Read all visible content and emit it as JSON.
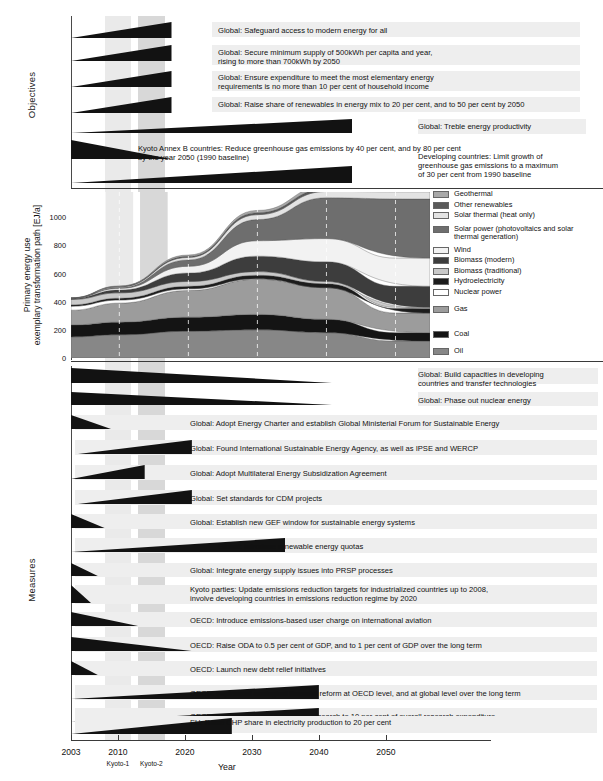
{
  "figure": {
    "sections": {
      "objectives_label": "Objectives",
      "measures_label": "Measures"
    },
    "x_axis": {
      "title": "Year",
      "ticks": [
        2003,
        2010,
        2020,
        2030,
        2040,
        2050
      ],
      "tick_labels": [
        "2003",
        "2010",
        "2020",
        "2030",
        "2040",
        "2050"
      ],
      "commitment_periods": [
        "Kyoto-1",
        "Kyoto-2"
      ],
      "range": [
        2003,
        2055
      ]
    },
    "shading": {
      "band1_color": "#eaeaea",
      "band2_color": "#d8d8d8",
      "band1_years": [
        2008,
        2012
      ],
      "band2_years": [
        2013,
        2017
      ]
    }
  },
  "objectives": [
    {
      "text": "Global: Safeguard access to modern energy for all",
      "wedge": {
        "start_year": 2003,
        "end_year": 2018,
        "shape": "grow",
        "align": "left"
      }
    },
    {
      "text": "Global: Secure minimum supply of 500kWh per capita and year,\nrising to more than 700kWh by 2050",
      "wedge": {
        "start_year": 2003,
        "end_year": 2018,
        "shape": "grow",
        "align": "left"
      }
    },
    {
      "text": "Global: Ensure expenditure to meet the most elementary energy\nrequirements is no more than 10 per cent of household income",
      "wedge": {
        "start_year": 2003,
        "end_year": 2018,
        "shape": "grow",
        "align": "left"
      }
    },
    {
      "text": "Global: Raise share of renewables in energy mix to 20 per cent, and to 50 per cent by 2050",
      "wedge": {
        "start_year": 2003,
        "end_year": 2018,
        "shape": "grow",
        "align": "left"
      }
    },
    {
      "text": "Global: Treble energy productivity",
      "wedge": {
        "start_year": 2003,
        "end_year": 2045,
        "shape": "grow",
        "align": "left"
      }
    },
    {
      "text": "Kyoto Annex B countries: Reduce greenhouse gas  emissions by 40 per cent, and by 80 per cent\nby the year 2050 (1990 baseline)",
      "wedge": {
        "start_year": 2003,
        "end_year": 2018,
        "shape": "shrink",
        "align": "left"
      }
    },
    {
      "text": "Developing countries: Limit growth of\ngreenhouse gas emissions to a maximum\nof 30 per cent from 1990 baseline",
      "wedge": {
        "start_year": 2003,
        "end_year": 2045,
        "shape": "grow",
        "align": "left"
      }
    }
  ],
  "measures": [
    {
      "text": "Global: Build capacities in developing\ncountries and transfer technologies",
      "wedge": {
        "start_year": 2003,
        "end_year": 2042,
        "shape": "shrink",
        "align": "left"
      }
    },
    {
      "text": "Global: Phase out nuclear energy",
      "wedge": {
        "start_year": 2003,
        "end_year": 2042,
        "shape": "shrink",
        "align": "left"
      }
    },
    {
      "text": "Global: Adopt Energy Charter and establish Global Ministerial Forum for Sustainable Energy",
      "wedge": {
        "start_year": 2003,
        "end_year": 2009,
        "shape": "shrink",
        "align": "left"
      }
    },
    {
      "text": "Global: Found International Sustainable Energy Agency, as well as IPSE and WERCP",
      "wedge": {
        "start_year": 2004,
        "end_year": 2021,
        "shape": "grow",
        "align": "left"
      }
    },
    {
      "text": "Global: Adopt Multilateral Energy Subsidization Agreement",
      "wedge": {
        "start_year": 2003,
        "end_year": 2014,
        "shape": "grow",
        "align": "left"
      }
    },
    {
      "text": "Global: Set standards for CDM projects",
      "wedge": {
        "start_year": 2004,
        "end_year": 2021,
        "shape": "grow",
        "align": "left"
      }
    },
    {
      "text": "Global: Establish new GEF window for sustainable energy systems",
      "wedge": {
        "start_year": 2003,
        "end_year": 2008,
        "shape": "shrink",
        "align": "left"
      }
    },
    {
      "text": "Global: Introduce renewable energy quotas",
      "wedge": {
        "start_year": 2003,
        "end_year": 2035,
        "shape": "grow",
        "align": "left"
      }
    },
    {
      "text": "Global: Integrate energy supply issues into PRSP processes",
      "wedge": {
        "start_year": 2003,
        "end_year": 2007,
        "shape": "shrink",
        "align": "left"
      }
    },
    {
      "text": "Kyoto parties: Update emissions reduction targets for industrialized countries up to 2008,\ninvolve developing countries in emissions reduction regime by 2020",
      "wedge": {
        "start_year": 2003,
        "end_year": 2006,
        "shape": "shrink",
        "align": "left"
      }
    },
    {
      "text": "OECD: Introduce emissions-based user charge on international aviation",
      "wedge": {
        "start_year": 2003,
        "end_year": 2013,
        "shape": "shrink",
        "align": "left"
      }
    },
    {
      "text": "OECD: Raise ODA to 0.5 per cent of GDP, and to 1 per cent of GDP over the long term",
      "wedge": {
        "start_year": 2003,
        "end_year": 2021,
        "shape": "shrink",
        "align": "left"
      }
    },
    {
      "text": "OECD: Launch new debt relief initiatives",
      "wedge": {
        "start_year": 2003,
        "end_year": 2007,
        "shape": "shrink",
        "align": "left"
      }
    },
    {
      "text": "OECD: Implement ecological financial reform at OECD level, and at global level over the long term",
      "wedge": {
        "start_year": 2003,
        "end_year": 2040,
        "shape": "grow",
        "align": "left"
      }
    },
    {
      "text": "OECD: Increase funding for energy research to 10 per cent of overall research expenditure",
      "wedge": {
        "start_year": 2003,
        "end_year": 2040,
        "shape": "grow",
        "align": "left"
      }
    },
    {
      "text": "EU: Raise CHP share in electricity production to 20 per cent",
      "wedge": {
        "start_year": 2003,
        "end_year": 2027,
        "shape": "grow",
        "align": "left"
      }
    }
  ],
  "chart_data": {
    "type": "area",
    "title": "",
    "xlabel": "Year",
    "ylabel": "Primary energy use\nexemplary transformation path [EJ/a]",
    "ylabel_line1": "Primary energy use",
    "ylabel_line2": "exemplary transformation path [EJ/a]",
    "x": [
      2003,
      2010,
      2020,
      2030,
      2040,
      2050
    ],
    "xlim": [
      2003,
      2055
    ],
    "ylim": [
      0,
      1180
    ],
    "yticks": [
      0,
      200,
      400,
      600,
      800,
      1000
    ],
    "ytick_labels": [
      "0",
      "200",
      "400",
      "600",
      "800",
      "1000"
    ],
    "grid": "dashed-vertical",
    "stack_order_bottom_to_top": [
      "Oil",
      "Coal",
      "Gas",
      "Nuclear power",
      "Hydroelectricity",
      "Biomass (traditional)",
      "Biomass (modern)",
      "Wind",
      "Solar power (photovoltaics and solar thermal generation)",
      "Solar thermal (heat only)",
      "Other renewables",
      "Geothermal"
    ],
    "series": [
      {
        "name": "Oil",
        "color": "#878787",
        "values": [
          150,
          165,
          190,
          200,
          180,
          120
        ]
      },
      {
        "name": "Coal",
        "color": "#141414",
        "values": [
          85,
          90,
          100,
          110,
          95,
          60
        ]
      },
      {
        "name": "Gas",
        "color": "#9c9c9c",
        "values": [
          105,
          135,
          190,
          250,
          225,
          140
        ]
      },
      {
        "name": "Nuclear power",
        "color": "#ffffff",
        "values": [
          28,
          22,
          12,
          4,
          0,
          0
        ]
      },
      {
        "name": "Hydroelectricity",
        "color": "#1c1c1c",
        "values": [
          10,
          13,
          18,
          24,
          28,
          32
        ]
      },
      {
        "name": "Biomass (traditional)",
        "color": "#c9c9c9",
        "values": [
          38,
          38,
          34,
          26,
          16,
          8
        ]
      },
      {
        "name": "Biomass (modern)",
        "color": "#3d3d3d",
        "values": [
          6,
          20,
          60,
          110,
          140,
          150
        ]
      },
      {
        "name": "Wind",
        "color": "#f2f2f2",
        "values": [
          2,
          12,
          48,
          110,
          165,
          200
        ]
      },
      {
        "name": "Solar power (photovoltaics and solar\nthermal generation)",
        "color": "#6e6e6e",
        "values": [
          1,
          6,
          45,
          150,
          290,
          420
        ]
      },
      {
        "name": "Solar thermal (heat only)",
        "color": "#e3e3e3",
        "values": [
          1,
          5,
          18,
          35,
          45,
          52
        ]
      },
      {
        "name": "Other renewables",
        "color": "#5a5a5a",
        "values": [
          1,
          3,
          8,
          14,
          18,
          20
        ]
      },
      {
        "name": "Geothermal",
        "color": "#a8a8a8",
        "values": [
          1,
          3,
          9,
          16,
          22,
          28
        ]
      }
    ],
    "legend": [
      {
        "label": "Geothermal",
        "color": "#a8a8a8"
      },
      {
        "label": "Other renewables",
        "color": "#5a5a5a"
      },
      {
        "label": "Solar thermal (heat only)",
        "color": "#e3e3e3"
      },
      {
        "label": "Solar power (photovoltaics and solar\nthermal generation)",
        "color": "#6e6e6e"
      },
      {
        "label": "Wind",
        "color": "#f2f2f2"
      },
      {
        "label": "Biomass (modern)",
        "color": "#3d3d3d"
      },
      {
        "label": "Biomass (traditional)",
        "color": "#c9c9c9"
      },
      {
        "label": "Hydroelectricity",
        "color": "#1c1c1c"
      },
      {
        "label": "Nuclear power",
        "color": "#ffffff"
      },
      {
        "label": "Gas",
        "color": "#9c9c9c"
      },
      {
        "label": "Coal",
        "color": "#141414"
      },
      {
        "label": "Oil",
        "color": "#878787"
      }
    ]
  }
}
